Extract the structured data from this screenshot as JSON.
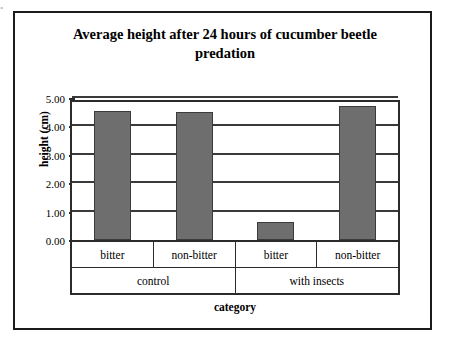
{
  "artifact": {
    "top_text": "."
  },
  "chart_data": {
    "type": "bar",
    "title": "Average height after 24 hours of cucumber beetle predation",
    "title_line1": "Average height after 24 hours of cucumber beetle",
    "title_line2": "predation",
    "xlabel": "category",
    "ylabel": "height (cm)",
    "ylim": [
      0,
      5
    ],
    "ytick_labels": [
      "5.00",
      "4.00",
      "3.00",
      "2.00",
      "1.00",
      "0.00"
    ],
    "ytick_values": [
      5,
      4,
      3,
      2,
      1,
      0
    ],
    "grid": true,
    "legend": "none",
    "categories": [
      "bitter",
      "non-bitter",
      "bitter",
      "non-bitter"
    ],
    "group_labels": [
      "control",
      "with insects"
    ],
    "groups": [
      {
        "label": "control",
        "span": 2
      },
      {
        "label": "with insects",
        "span": 2
      }
    ],
    "values": [
      4.55,
      4.5,
      0.65,
      4.72
    ],
    "bar_color": "#6e6e6e",
    "bar_edge_color": "#3b3b3b",
    "bars": [
      {
        "group": "control",
        "category": "bitter",
        "value": 4.55
      },
      {
        "group": "control",
        "category": "non-bitter",
        "value": 4.5
      },
      {
        "group": "with insects",
        "category": "bitter",
        "value": 0.65
      },
      {
        "group": "with insects",
        "category": "non-bitter",
        "value": 4.72
      }
    ]
  }
}
